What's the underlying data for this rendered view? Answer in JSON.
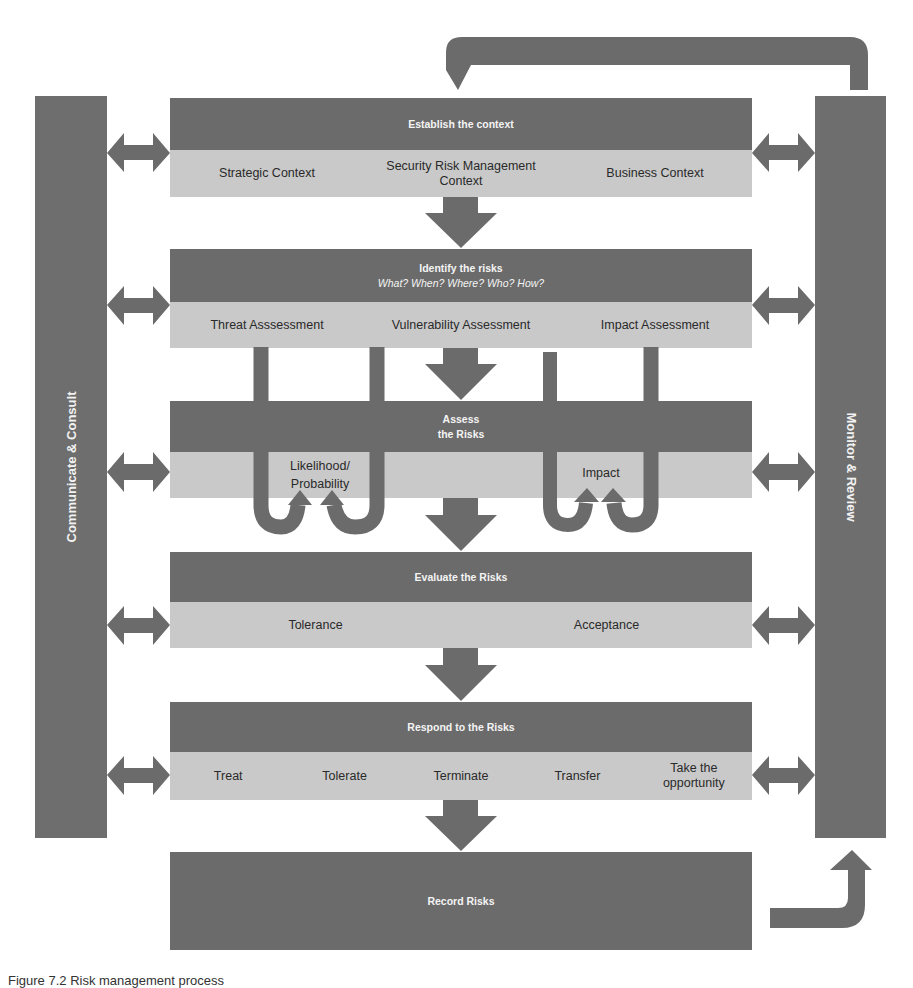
{
  "diagram": {
    "colors": {
      "dark": "#6b6b6b",
      "light": "#c9c9c9",
      "bar": "#6e6e6e",
      "text_on_dark": "#f4f4f4",
      "text_on_light": "#2a2a2a"
    },
    "side_bars": {
      "left": {
        "label": "Communicate & Consult"
      },
      "right": {
        "label": "Monitor & Review"
      }
    },
    "sections": [
      {
        "title": "Establish the context",
        "subtitle": "",
        "items": [
          "Strategic Context",
          "Security Risk Management Context",
          "Business Context"
        ]
      },
      {
        "title": "Identify the risks",
        "subtitle": "What? When? Where? Who? How?",
        "items": [
          "Threat Asssessment",
          "Vulnerability Assessment",
          "Impact Assessment"
        ]
      },
      {
        "title": "Assess the Risks",
        "title_line1": "Assess",
        "title_line2": "the Risks",
        "items": [
          "Likelihood/ Probability",
          "Impact"
        ]
      },
      {
        "title": "Evaluate the Risks",
        "subtitle": "",
        "items": [
          "Tolerance",
          "Acceptance"
        ]
      },
      {
        "title": "Respond to the Risks",
        "subtitle": "",
        "items": [
          "Treat",
          "Tolerate",
          "Terminate",
          "Transfer",
          "Take the opportunity"
        ]
      },
      {
        "title": "Record Risks",
        "subtitle": "",
        "items": []
      }
    ],
    "assess_items": {
      "likelihood_line1": "Likelihood/",
      "likelihood_line2": "Probability",
      "impact": "Impact"
    },
    "respond_items": {
      "take_line1": "Take the",
      "take_line2": "opportunity"
    },
    "establish_items": {
      "srm_line1": "Security Risk Management",
      "srm_line2": "Context"
    }
  },
  "caption": "Figure 7.2 Risk management process"
}
